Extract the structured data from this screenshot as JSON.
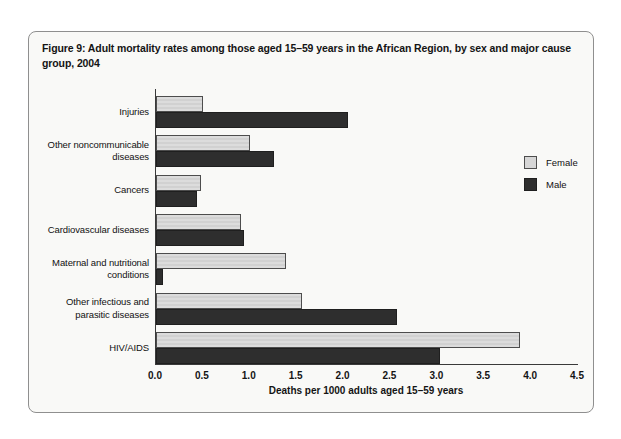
{
  "figure": {
    "title": "Figure 9: Adult mortality rates among those aged 15–59 years in the African Region, by sex and major cause group, 2004"
  },
  "legend": {
    "items": [
      {
        "label": "Female",
        "color": "#d6d6d6"
      },
      {
        "label": "Male",
        "color": "#2e2e2e"
      }
    ]
  },
  "chart_data": {
    "type": "bar",
    "orientation": "horizontal",
    "title": "Figure 9: Adult mortality rates among those aged 15–59 years in the African Region, by sex and major cause group, 2004",
    "categories": [
      "Injuries",
      "Other noncommunicable diseases",
      "Cancers",
      "Cardiovascular diseases",
      "Maternal and nutritional conditions",
      "Other infectious and parasitic diseases",
      "HIV/AIDS"
    ],
    "series": [
      {
        "name": "Female",
        "color": "#d6d6d6",
        "values": [
          0.5,
          1.0,
          0.48,
          0.91,
          1.39,
          1.56,
          3.88
        ]
      },
      {
        "name": "Male",
        "color": "#2e2e2e",
        "values": [
          2.05,
          1.26,
          0.44,
          0.94,
          0.07,
          2.57,
          3.03
        ]
      }
    ],
    "xlabel": "Deaths per 1000 adults aged 15–59 years",
    "xticks": [
      "0.0",
      "0.5",
      "1.0",
      "1.5",
      "2.0",
      "2.5",
      "3.0",
      "3.5",
      "4.0",
      "4.5"
    ],
    "xlim": [
      0,
      4.5
    ],
    "grid": false,
    "legend_position": "right"
  }
}
